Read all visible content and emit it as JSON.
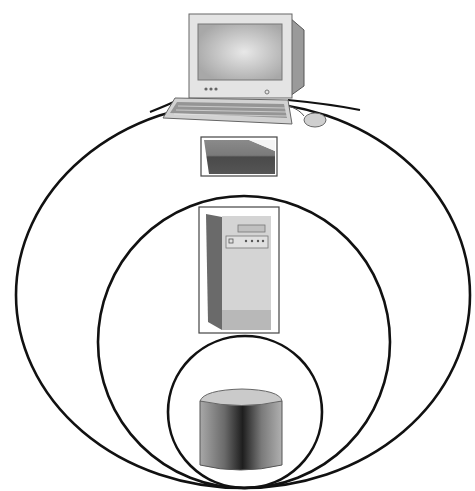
{
  "diagram": {
    "type": "nested-layers",
    "background": "#ffffff",
    "stroke_color": "#111111",
    "layers": [
      {
        "name": "outer-layer",
        "shape": "ellipse",
        "icons": [
          "desktop-computer",
          "thin-device"
        ]
      },
      {
        "name": "middle-layer",
        "shape": "ellipse",
        "icons": [
          "tower-server"
        ]
      },
      {
        "name": "inner-layer",
        "shape": "circle",
        "icons": [
          "database-cylinder"
        ]
      }
    ],
    "colors": {
      "monitor_body": "#e2e2e2",
      "monitor_screen": "#bdbdbd",
      "keyboard": "#d4d4d4",
      "device_dark": "#5a5a5a",
      "server_front": "#d0d0d0",
      "server_side": "#6a6a6a",
      "cylinder_top": "#c8c8c8",
      "cylinder_dark": "#2a2a2a"
    }
  }
}
